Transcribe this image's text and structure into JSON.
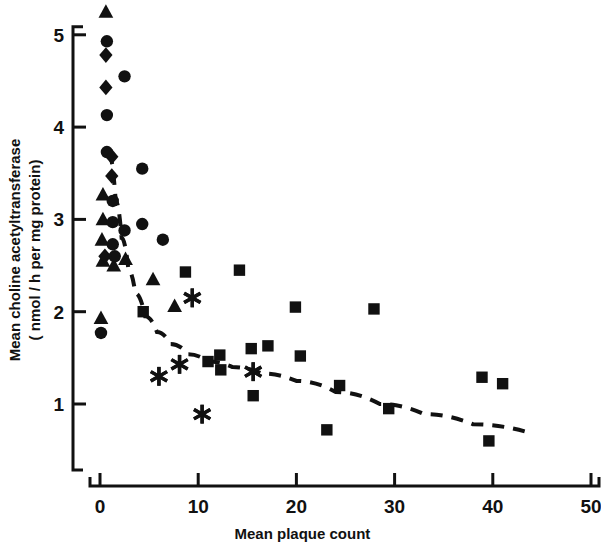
{
  "chart_data": {
    "type": "scatter",
    "title": "",
    "xlabel": "Mean plaque count",
    "ylabel": "Mean choline acetyltransferase (nmol/h per mg protein)",
    "ylabel_line1": "Mean choline acetyltransferase",
    "ylabel_line2": "( nmol / h per mg protein)",
    "xlim": [
      -3,
      52
    ],
    "ylim": [
      0.35,
      5.35
    ],
    "xticks": [
      0,
      10,
      20,
      30,
      40,
      50
    ],
    "yticks": [
      1,
      2,
      3,
      4,
      5
    ],
    "xtick_labels": [
      "0",
      "10",
      "20",
      "30",
      "40",
      "50"
    ],
    "ytick_labels": [
      "1",
      "2",
      "3",
      "4",
      "5"
    ],
    "grid": false,
    "legend": "none",
    "marker_color": "#111111",
    "series": [
      {
        "name": "triangle-group",
        "marker": "triangle",
        "points": [
          [
            0.6,
            5.25
          ],
          [
            0.3,
            3.27
          ],
          [
            0.3,
            3.0
          ],
          [
            0.2,
            2.78
          ],
          [
            0.3,
            2.55
          ],
          [
            1.4,
            2.5
          ],
          [
            2.6,
            2.57
          ],
          [
            0.1,
            1.93
          ],
          [
            7.6,
            2.06
          ],
          [
            5.4,
            2.35
          ]
        ]
      },
      {
        "name": "circle-group",
        "marker": "circle",
        "points": [
          [
            0.7,
            4.93
          ],
          [
            2.5,
            4.55
          ],
          [
            0.7,
            4.13
          ],
          [
            0.7,
            3.73
          ],
          [
            4.3,
            3.55
          ],
          [
            1.3,
            3.2
          ],
          [
            1.3,
            2.97
          ],
          [
            4.3,
            2.95
          ],
          [
            2.5,
            2.88
          ],
          [
            6.4,
            2.78
          ],
          [
            1.3,
            2.73
          ],
          [
            1.5,
            2.6
          ],
          [
            0.1,
            1.77
          ]
        ]
      },
      {
        "name": "diamond-group",
        "marker": "diamond",
        "points": [
          [
            0.6,
            4.78
          ],
          [
            0.6,
            4.43
          ],
          [
            1.2,
            3.68
          ],
          [
            1.2,
            3.47
          ],
          [
            0.5,
            2.6
          ]
        ]
      },
      {
        "name": "square-group",
        "marker": "square",
        "points": [
          [
            4.4,
            2.0
          ],
          [
            8.7,
            2.43
          ],
          [
            14.2,
            2.45
          ],
          [
            19.9,
            2.05
          ],
          [
            27.9,
            2.03
          ],
          [
            11.0,
            1.46
          ],
          [
            12.2,
            1.53
          ],
          [
            12.3,
            1.37
          ],
          [
            15.4,
            1.6
          ],
          [
            17.1,
            1.63
          ],
          [
            20.4,
            1.52
          ],
          [
            24.4,
            1.2
          ],
          [
            29.4,
            0.95
          ],
          [
            15.6,
            1.09
          ],
          [
            23.1,
            0.72
          ],
          [
            38.9,
            1.29
          ],
          [
            41.0,
            1.22
          ],
          [
            39.6,
            0.6
          ]
        ]
      },
      {
        "name": "asterisk-group",
        "marker": "asterisk",
        "points": [
          [
            9.4,
            2.15
          ],
          [
            8.1,
            1.43
          ],
          [
            6.0,
            1.3
          ],
          [
            15.6,
            1.35
          ],
          [
            10.4,
            0.89
          ]
        ]
      }
    ],
    "fit_curve": {
      "name": "fitted-decay-curve",
      "style": "dashed",
      "points": [
        [
          0.9,
          3.72
        ],
        [
          1.6,
          3.2
        ],
        [
          2.2,
          2.8
        ],
        [
          2.9,
          2.45
        ],
        [
          3.6,
          2.2
        ],
        [
          4.6,
          1.95
        ],
        [
          5.8,
          1.78
        ],
        [
          7.2,
          1.65
        ],
        [
          9.0,
          1.54
        ],
        [
          11.0,
          1.46
        ],
        [
          13.5,
          1.4
        ],
        [
          16.5,
          1.33
        ],
        [
          20.0,
          1.25
        ],
        [
          24.0,
          1.13
        ],
        [
          28.5,
          1.0
        ],
        [
          33.0,
          0.89
        ],
        [
          38.0,
          0.78
        ],
        [
          44.0,
          0.68
        ]
      ]
    }
  }
}
